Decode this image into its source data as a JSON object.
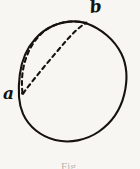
{
  "figure": {
    "background_color": "#f7f6f3",
    "ink_color": "#15120f",
    "caption": "Fig.",
    "labels": {
      "point_a": "a",
      "point_b": "b"
    },
    "geometry": {
      "circle": {
        "center_x": 72,
        "center_y": 88,
        "radius": 54,
        "stroke_width": 2.1,
        "style": "solid"
      },
      "point_a": {
        "x": 22,
        "y": 93
      },
      "point_b": {
        "x": 86,
        "y": 23
      },
      "dashed_arc": {
        "description": "dashed arc bulging up and left from point a to point b",
        "control_x": 22,
        "control_y": 26,
        "dash_pattern": "4 3.5",
        "stroke_width": 2.1
      },
      "dashed_chord": {
        "description": "dashed slightly curved chord from point a to point b",
        "control_x": 45,
        "control_y": 52,
        "dash_pattern": "4 3.5",
        "stroke_width": 2.1
      }
    }
  }
}
